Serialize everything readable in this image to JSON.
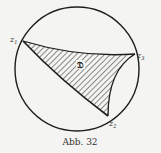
{
  "figure": {
    "caption": "Abb. 32",
    "region_label": "𝔇",
    "vertices": [
      {
        "name": "z",
        "sub": "1"
      },
      {
        "name": "z",
        "sub": "3"
      },
      {
        "name": "z",
        "sub": "2"
      }
    ],
    "colors": {
      "ink": "#1e1e1e",
      "background": "#f4f4f2"
    }
  }
}
